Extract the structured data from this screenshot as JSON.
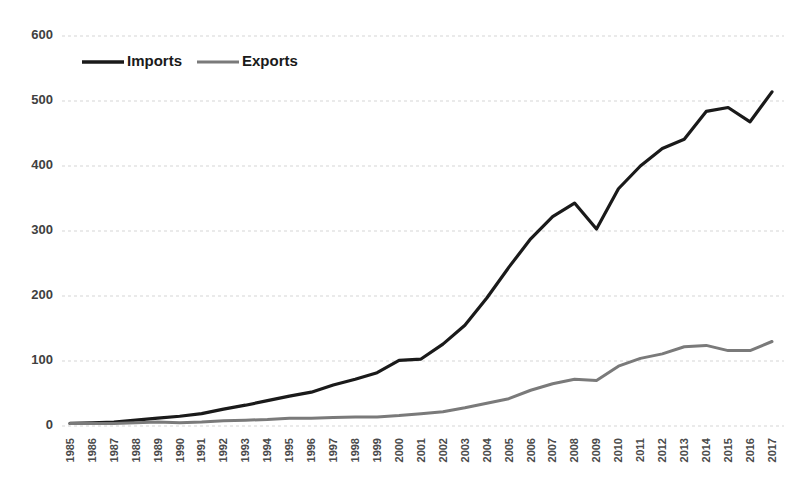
{
  "chart_data": {
    "type": "line",
    "title": "",
    "subtitle": "",
    "xlabel": "",
    "ylabel": "",
    "ylim": [
      0,
      600
    ],
    "yticks": [
      0,
      100,
      200,
      300,
      400,
      500,
      600
    ],
    "grid": true,
    "legend_position": "top-left",
    "categories": [
      "1985",
      "1986",
      "1987",
      "1988",
      "1989",
      "1990",
      "1991",
      "1992",
      "1993",
      "1994",
      "1995",
      "1996",
      "1997",
      "1998",
      "1999",
      "2000",
      "2001",
      "2002",
      "2003",
      "2004",
      "2005",
      "2006",
      "2007",
      "2008",
      "2009",
      "2010",
      "2011",
      "2012",
      "2013",
      "2014",
      "2015",
      "2016",
      "2017"
    ],
    "series": [
      {
        "name": "Imports",
        "color": "#1a1a1a",
        "values": [
          4,
          5,
          6,
          9,
          12,
          15,
          19,
          26,
          32,
          39,
          46,
          52,
          63,
          72,
          82,
          101,
          103,
          126,
          155,
          197,
          244,
          288,
          322,
          343,
          303,
          365,
          400,
          427,
          441,
          484,
          490,
          468,
          514
        ]
      },
      {
        "name": "Exports",
        "color": "#7a7a7a",
        "values": [
          4,
          4,
          4,
          5,
          6,
          5,
          6,
          8,
          9,
          10,
          12,
          12,
          13,
          14,
          14,
          16,
          19,
          22,
          28,
          35,
          42,
          55,
          65,
          72,
          70,
          92,
          104,
          111,
          122,
          124,
          116,
          116,
          130
        ]
      }
    ]
  },
  "axes": {
    "y_tick_labels": [
      "600",
      "500",
      "400",
      "300",
      "200",
      "100",
      "0"
    ],
    "x_tick_labels": [
      "1985",
      "1986",
      "1987",
      "1988",
      "1989",
      "1990",
      "1991",
      "1992",
      "1993",
      "1994",
      "1995",
      "1996",
      "1997",
      "1998",
      "1999",
      "2000",
      "2001",
      "2002",
      "2003",
      "2004",
      "2005",
      "2006",
      "2007",
      "2008",
      "2009",
      "2010",
      "2011",
      "2012",
      "2013",
      "2014",
      "2015",
      "2016",
      "2017"
    ]
  },
  "legend": {
    "items": [
      {
        "label": "Imports",
        "color": "#1a1a1a"
      },
      {
        "label": "Exports",
        "color": "#7a7a7a"
      }
    ]
  },
  "colors": {
    "imports": "#1a1a1a",
    "exports": "#7a7a7a",
    "gridline": "#d0d0d0",
    "tick_text": "#404040",
    "background": "#ffffff"
  }
}
